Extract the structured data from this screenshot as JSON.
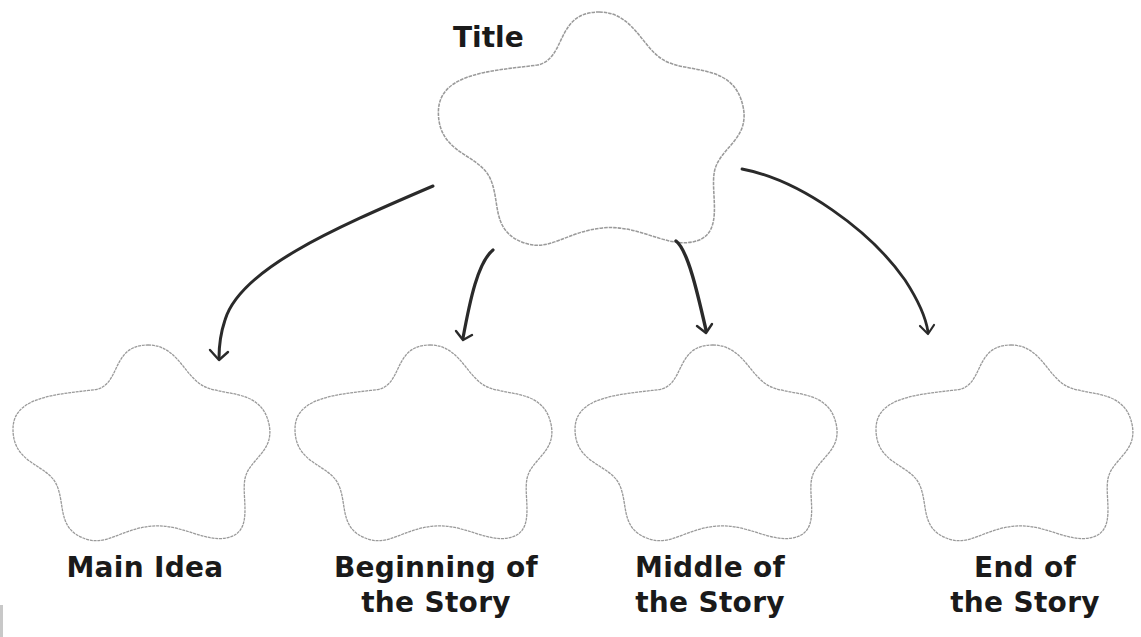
{
  "diagram": {
    "type": "story-map graphic organizer",
    "title_node": {
      "label": "Title"
    },
    "child_nodes": [
      {
        "id": "main-idea",
        "label_lines": [
          "Main Idea"
        ]
      },
      {
        "id": "beginning",
        "label_lines": [
          "Beginning of",
          "the Story"
        ]
      },
      {
        "id": "middle",
        "label_lines": [
          "Middle of",
          "the Story"
        ]
      },
      {
        "id": "end",
        "label_lines": [
          "End of",
          "the Story"
        ]
      }
    ],
    "edges": [
      {
        "from": "title",
        "to": "main-idea"
      },
      {
        "from": "title",
        "to": "beginning"
      },
      {
        "from": "title",
        "to": "middle"
      },
      {
        "from": "title",
        "to": "end"
      }
    ],
    "colors": {
      "cloud_outline": "#9a9a9a",
      "arrow": "#2a2a2a",
      "text": "#1a1a1a",
      "background": "#ffffff"
    }
  }
}
